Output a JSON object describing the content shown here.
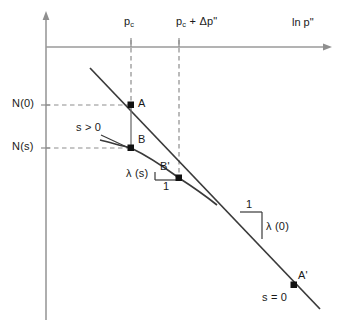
{
  "figure": {
    "type": "diagram",
    "background_color": "#ffffff",
    "line_color": "#3a3a3a",
    "dash_color": "#8a8a8a",
    "axis_color": "#9a9a9a",
    "text_color": "#1a1a1a"
  },
  "axes": {
    "x": {
      "title": "ln p\"",
      "title_x": 292,
      "title_y": 22,
      "arrow": true,
      "y_pixel": 47,
      "x_start": 46,
      "x_end": 330
    },
    "y": {
      "title": "specific volume",
      "arrow": true,
      "x_pixel": 46,
      "y_top": 14,
      "y_bottom": 320
    }
  },
  "x_ticks": [
    {
      "label_html": "p<sub>c</sub>",
      "label_text": "p_c",
      "x": 124,
      "y": 22,
      "gridline_x": 131,
      "gridline_y_end": 105
    },
    {
      "label_html": "p<sub>c</sub> + Δp\"",
      "label_text": "p_c + Δp\"",
      "x": 176,
      "y": 22,
      "gridline_x": 179,
      "gridline_y_end": 178
    }
  ],
  "y_ticks": [
    {
      "label": "N(0)",
      "x": 12,
      "y": 99,
      "gridline_y": 105,
      "gridline_x_end": 131
    },
    {
      "label": "N(s)",
      "x": 12,
      "y": 142,
      "gridline_y": 148,
      "gridline_x_end": 131
    }
  ],
  "points": [
    {
      "name": "A",
      "label": "A",
      "x": 131,
      "y": 105,
      "label_x": 137,
      "label_y": 99
    },
    {
      "name": "B",
      "label": "B",
      "x": 131,
      "y": 148,
      "label_x": 137,
      "label_y": 135
    },
    {
      "name": "B'",
      "label": "B'",
      "x": 179,
      "y": 178,
      "label_x": 161,
      "label_y": 163
    },
    {
      "name": "A'",
      "label": "A'",
      "x": 294,
      "y": 285,
      "label_x": 298,
      "label_y": 272
    }
  ],
  "curves": [
    {
      "name": "s-equals-zero-line",
      "style": "solid",
      "description": "straight normal compression line for zero suction",
      "path": "M 90,68 L 320,309"
    },
    {
      "name": "s-greater-than-zero-curve",
      "style": "solid",
      "description": "curved normal compression line for positive suction",
      "path": "M 100,140 C 112,143 122,146 131,148 C 152,158 168,170 179,178 C 193,187 207,197 217,205"
    }
  ],
  "annotations": [
    {
      "name": "suction-positive",
      "label": "s > 0",
      "x": 78,
      "y": 127,
      "leader_from": [
        104,
        137
      ],
      "leader_to": [
        131,
        148
      ]
    },
    {
      "name": "suction-zero",
      "label": "s = 0",
      "x": 262,
      "y": 297
    },
    {
      "name": "lambda-s",
      "label": "λ (s)",
      "x": 127,
      "y": 173
    },
    {
      "name": "lambda-s-one",
      "label": "1",
      "x": 163,
      "y": 185
    },
    {
      "name": "lambda-zero",
      "label": "λ (0)",
      "x": 264,
      "y": 226
    },
    {
      "name": "lambda-zero-one",
      "label": "1",
      "x": 246,
      "y": 205
    }
  ],
  "slope_triangles": [
    {
      "name": "lambda-s-triangle",
      "x1": 155,
      "y1": 172,
      "x2": 179,
      "y2": 172,
      "x3": 179,
      "y3": 180
    },
    {
      "name": "lambda-zero-triangle",
      "x1": 240,
      "y1": 212,
      "x2": 262,
      "y2": 212,
      "x3": 262,
      "y3": 238
    }
  ],
  "connector": {
    "name": "A-to-B-segment",
    "x": 131,
    "y1": 105,
    "y2": 148
  }
}
